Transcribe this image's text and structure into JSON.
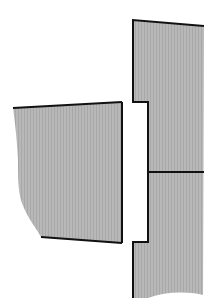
{
  "diagram": {
    "colors": {
      "fill": "#b4b4b4",
      "outline": "#111111",
      "background": "#ffffff"
    },
    "left_block": {
      "label": ""
    },
    "right_block": {
      "label": ""
    }
  }
}
